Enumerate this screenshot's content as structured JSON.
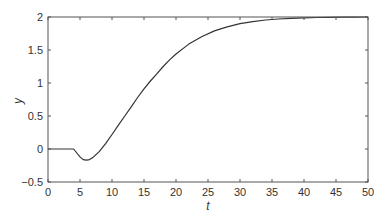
{
  "chart_data": {
    "type": "line",
    "title": "",
    "xlabel": "t",
    "ylabel": "y",
    "xlim": [
      0,
      50
    ],
    "ylim": [
      -0.5,
      2
    ],
    "grid": false,
    "legend": null,
    "xticks": [
      0,
      5,
      10,
      15,
      20,
      25,
      30,
      35,
      40,
      45,
      50
    ],
    "yticks": [
      -0.5,
      0,
      0.5,
      1,
      1.5,
      2
    ],
    "ytick_labels": [
      "-0.5",
      "0",
      "0.5",
      "1",
      "1.5",
      "2"
    ],
    "series": [
      {
        "name": "y(t)",
        "color": "#333333",
        "x": [
          0,
          2,
          4,
          4.5,
          5,
          5.5,
          6,
          6.5,
          7,
          8,
          9,
          10,
          11,
          12,
          13,
          14,
          15,
          16,
          17,
          18,
          19,
          20,
          22,
          24,
          26,
          28,
          30,
          32,
          34,
          36,
          38,
          40,
          42,
          44,
          46,
          48,
          50
        ],
        "y": [
          0,
          0,
          0,
          -0.06,
          -0.12,
          -0.16,
          -0.17,
          -0.16,
          -0.13,
          -0.04,
          0.08,
          0.22,
          0.36,
          0.5,
          0.64,
          0.78,
          0.91,
          1.03,
          1.14,
          1.25,
          1.35,
          1.44,
          1.59,
          1.7,
          1.79,
          1.85,
          1.9,
          1.93,
          1.955,
          1.97,
          1.98,
          1.988,
          1.993,
          1.996,
          1.998,
          1.999,
          2.0
        ]
      }
    ]
  }
}
